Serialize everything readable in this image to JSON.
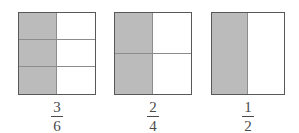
{
  "canvas": {
    "width": 299,
    "height": 133,
    "background": "#ffffff"
  },
  "style": {
    "shaded_color": "#bbbbbb",
    "unshaded_color": "#ffffff",
    "outer_border_color": "#585858",
    "inner_grid_color": "#8d8d8d",
    "label_color": "#4a4a4a"
  },
  "chart_data": {
    "type": "bar",
    "title": "",
    "subtitle": "",
    "xlabel": "",
    "ylabel": "",
    "categories": [
      "3/6",
      "2/4",
      "1/2"
    ],
    "values": [
      0.5,
      0.5,
      0.5
    ],
    "legend": [],
    "grid": true,
    "models": [
      {
        "id": "model-3-6",
        "columns": 2,
        "rows": 3,
        "total_parts": 6,
        "shaded_parts": 3,
        "shaded_cells": [
          0,
          2,
          4
        ],
        "fraction_value": 0.5,
        "numerator": "3",
        "denominator": "6",
        "label": "3/6"
      },
      {
        "id": "model-2-4",
        "columns": 2,
        "rows": 2,
        "total_parts": 4,
        "shaded_parts": 2,
        "shaded_cells": [
          0,
          2
        ],
        "fraction_value": 0.5,
        "numerator": "2",
        "denominator": "4",
        "label": "2/4"
      },
      {
        "id": "model-1-2",
        "columns": 2,
        "rows": 1,
        "total_parts": 2,
        "shaded_parts": 1,
        "shaded_cells": [
          0
        ],
        "fraction_value": 0.5,
        "numerator": "1",
        "denominator": "2",
        "label": "1/2"
      }
    ]
  }
}
